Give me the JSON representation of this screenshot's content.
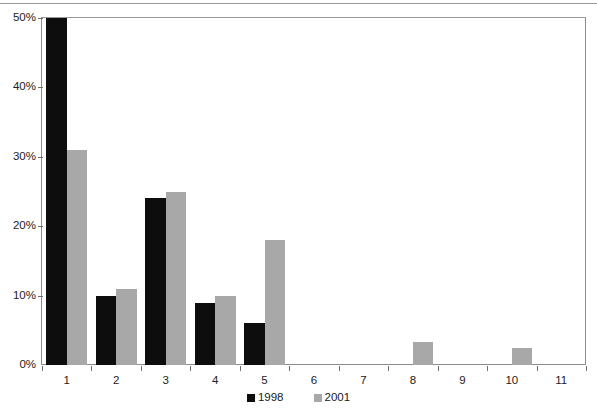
{
  "chart_data": {
    "type": "bar",
    "title": "",
    "xlabel": "",
    "ylabel": "",
    "categories": [
      "1",
      "2",
      "3",
      "4",
      "5",
      "6",
      "7",
      "8",
      "9",
      "10",
      "11"
    ],
    "series": [
      {
        "name": "1998",
        "color": "#0d0d0d",
        "values": [
          50,
          10,
          24,
          9,
          6,
          0,
          0,
          0,
          0,
          0,
          0
        ]
      },
      {
        "name": "2001",
        "color": "#a8a8a8",
        "values": [
          31,
          11,
          25,
          10,
          18,
          0,
          0,
          3.3,
          0,
          2.4,
          0
        ]
      }
    ],
    "ylim": [
      0,
      50
    ],
    "yticks": [
      0,
      10,
      20,
      30,
      40,
      50
    ],
    "ytick_labels": [
      "0%",
      "10%",
      "20%",
      "30%",
      "40%",
      "50%"
    ],
    "grid": false,
    "legend_position": "bottom"
  },
  "axes": {
    "y_labels": [
      "50%",
      "40%",
      "30%",
      "20%",
      "10%",
      "0%"
    ],
    "x_labels": [
      "1",
      "2",
      "3",
      "4",
      "5",
      "6",
      "7",
      "8",
      "9",
      "10",
      "11"
    ]
  },
  "legend": {
    "items": [
      {
        "label": "1998",
        "color": "#0d0d0d"
      },
      {
        "label": "2001",
        "color": "#a8a8a8"
      }
    ]
  },
  "colors": {
    "series_1998": "#0d0d0d",
    "series_2001": "#a8a8a8",
    "frame": "#8c8c8c",
    "background": "#ffffff"
  }
}
